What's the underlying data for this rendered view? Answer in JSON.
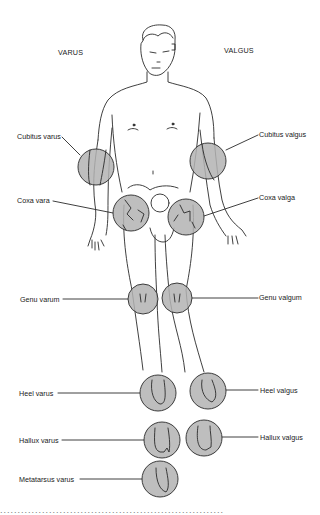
{
  "headers": {
    "left": "VARUS",
    "right": "VALGUS"
  },
  "labels": {
    "cubitus_varus": "Cubitus varus",
    "cubitus_valgus": "Cubitus valgus",
    "coxa_vara": "Coxa vara",
    "coxa_valga": "Coxa valga",
    "genu_varum": "Genu varum",
    "genu_valgum": "Genu valgum",
    "heel_varus": "Heel varus",
    "heel_valgus": "Heel valgus",
    "hallux_varus": "Hallux varus",
    "hallux_valgus": "Hallux valgus",
    "metatarsus_varus": "Metatarsus varus"
  },
  "colors": {
    "highlight_fill": "#b3b3b3",
    "line": "#2a2a2a"
  },
  "caption": "................................................................"
}
